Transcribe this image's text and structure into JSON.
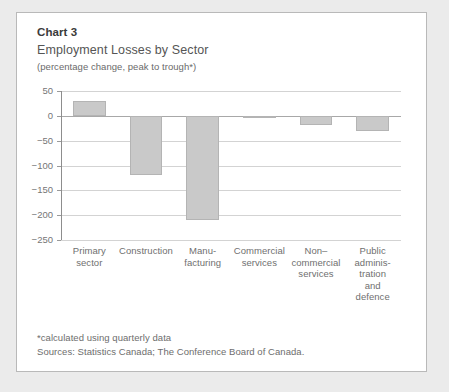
{
  "panel": {
    "header": {
      "chart_number": "Chart 3",
      "title": "Employment Losses by Sector",
      "subtitle": "(percentage change, peak to trough*)"
    },
    "footnotes": [
      "*calculated using quarterly data",
      "Sources: Statistics Canada; The Conference Board of Canada."
    ]
  },
  "chart_data": {
    "type": "bar",
    "title": "Employment Losses by Sector",
    "subtitle": "(percentage change, peak to trough*)",
    "xlabel": "",
    "ylabel": "",
    "ylim": [
      -250,
      50
    ],
    "yticks": [
      50,
      0,
      -50,
      -100,
      -150,
      -200,
      -250
    ],
    "ytick_labels": [
      "50",
      "0",
      "−50",
      "−100",
      "−150",
      "−200",
      "−250"
    ],
    "grid": true,
    "legend": "none",
    "categories": [
      "Primary sector",
      "Construction",
      "Manufacturing",
      "Commercial services",
      "Non-commercial services",
      "Public administration and defence"
    ],
    "category_label_lines": [
      [
        "Primary",
        "sector"
      ],
      [
        "Construction"
      ],
      [
        "Manu-",
        "facturing"
      ],
      [
        "Commercial",
        "services"
      ],
      [
        "Non–",
        "commercial",
        "services"
      ],
      [
        "Public",
        "adminis-",
        "tration",
        "and",
        "defence"
      ]
    ],
    "values": [
      30,
      -120,
      -210,
      -5,
      -18,
      -30
    ],
    "bar_color": "#c9c9c9",
    "bar_border_color": "#b4b4b4"
  }
}
